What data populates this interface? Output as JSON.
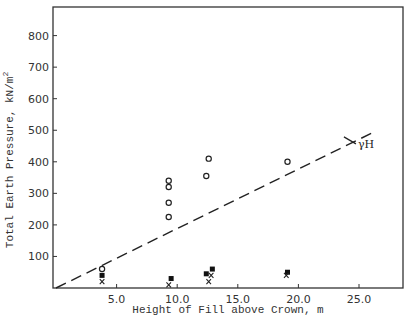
{
  "chart_data": {
    "type": "scatter",
    "title": "",
    "xlabel": "Height of Fill above Crown, m",
    "ylabel": "Total Earth Pressure, kN/m²",
    "ylabel_main": "Total Earth Pressure, kN/m",
    "ylabel_sup": "2",
    "xlim": [
      0,
      28.5
    ],
    "ylim": [
      0,
      880
    ],
    "x_ticks": [
      5.0,
      10.0,
      15.0,
      20.0,
      25.0
    ],
    "x_tick_labels": [
      "5.0",
      "10.0",
      "15.0",
      "20.0",
      "25.0"
    ],
    "y_ticks": [
      100,
      200,
      300,
      400,
      500,
      600,
      700,
      800
    ],
    "y_tick_labels": [
      "100",
      "200",
      "300",
      "400",
      "500",
      "600",
      "700",
      "800"
    ],
    "grid": false,
    "series": [
      {
        "name": "open circles",
        "marker": "o",
        "points": [
          [
            3.8,
            60
          ],
          [
            9.3,
            340
          ],
          [
            9.3,
            320
          ],
          [
            9.3,
            270
          ],
          [
            9.3,
            225
          ],
          [
            12.6,
            410
          ],
          [
            12.4,
            355
          ],
          [
            19.1,
            400
          ]
        ]
      },
      {
        "name": "filled squares",
        "marker": "s",
        "points": [
          [
            3.8,
            40
          ],
          [
            9.5,
            30
          ],
          [
            12.4,
            45
          ],
          [
            12.9,
            60
          ],
          [
            19.1,
            50
          ]
        ]
      },
      {
        "name": "crosses",
        "marker": "x",
        "points": [
          [
            3.8,
            20
          ],
          [
            9.3,
            10
          ],
          [
            12.6,
            20
          ],
          [
            12.8,
            40
          ],
          [
            19.0,
            40
          ]
        ]
      },
      {
        "name": "γH",
        "type": "line",
        "style": "dashed",
        "points": [
          [
            0,
            0
          ],
          [
            26.0,
            490
          ]
        ]
      }
    ],
    "annotations": [
      {
        "text": "γH",
        "x": 24.5,
        "y": 460
      }
    ]
  }
}
